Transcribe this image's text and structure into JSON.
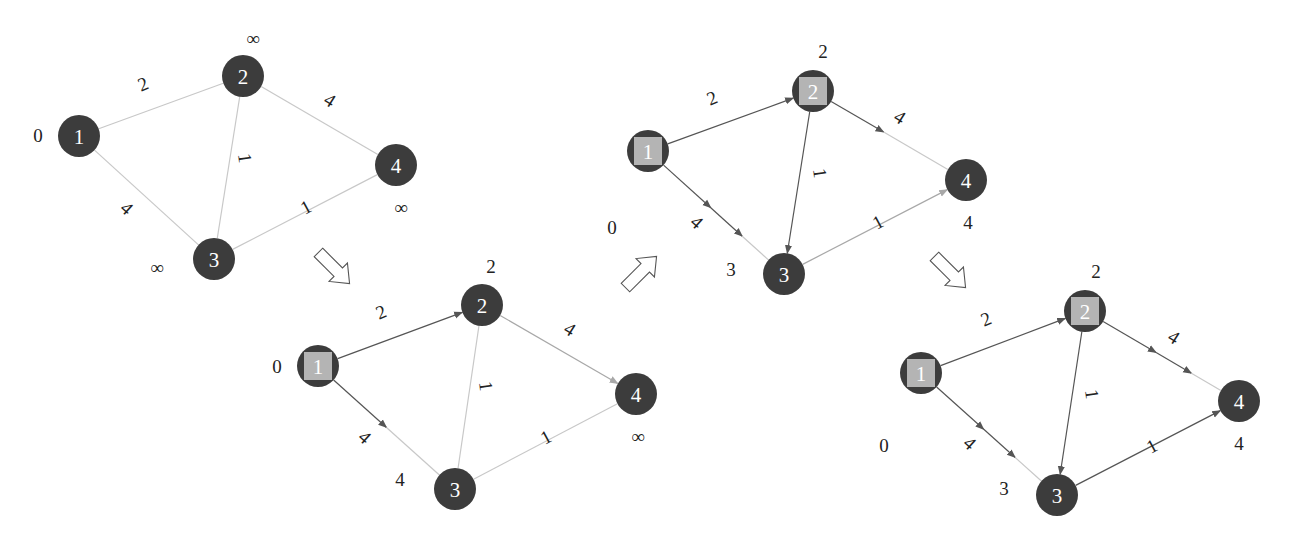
{
  "colors": {
    "node_fill": "#3c3c3c",
    "visited_square": "#b4b4b4",
    "edge_inactive": "#c8c8c8",
    "edge_active": "#555555",
    "edge_candidate": "#a8a8a8",
    "text": "#222222"
  },
  "step_arrows": [
    {
      "name": "step-arrow-1-to-2",
      "x": 334,
      "y": 268,
      "angle": 45
    },
    {
      "name": "step-arrow-2-to-3",
      "x": 641,
      "y": 272,
      "angle": -45
    },
    {
      "name": "step-arrow-3-to-4",
      "x": 950,
      "y": 272,
      "angle": 45
    }
  ],
  "panels": [
    {
      "name": "panel-initial",
      "nodes": [
        {
          "id": "1",
          "x": 79,
          "y": 136,
          "visited": false,
          "dist": "0",
          "dx": -41,
          "dy": -1
        },
        {
          "id": "2",
          "x": 243,
          "y": 76,
          "visited": false,
          "dist": "∞",
          "dx": 10,
          "dy": -38
        },
        {
          "id": "3",
          "x": 214,
          "y": 259,
          "visited": false,
          "dist": "∞",
          "dx": -57,
          "dy": 8
        },
        {
          "id": "4",
          "x": 396,
          "y": 165,
          "visited": false,
          "dist": "∞",
          "dx": 5,
          "dy": 42
        }
      ],
      "edges": [
        {
          "from": "1",
          "to": "2",
          "weight": "2",
          "state": "inactive",
          "lx": 143,
          "ly": 84,
          "rot": -22
        },
        {
          "from": "1",
          "to": "3",
          "weight": "4",
          "state": "inactive",
          "lx": 127,
          "ly": 208,
          "rot": 42
        },
        {
          "from": "2",
          "to": "3",
          "weight": "1",
          "state": "inactive",
          "lx": 245,
          "ly": 158,
          "rot": 82
        },
        {
          "from": "2",
          "to": "4",
          "weight": "4",
          "state": "inactive",
          "lx": 330,
          "ly": 100,
          "rot": 32
        },
        {
          "from": "3",
          "to": "4",
          "weight": "1",
          "state": "inactive",
          "lx": 306,
          "ly": 207,
          "rot": -28
        }
      ]
    },
    {
      "name": "panel-step-1",
      "nodes": [
        {
          "id": "1",
          "x": 318,
          "y": 366,
          "visited": true,
          "dist": "0",
          "dx": -41,
          "dy": 0
        },
        {
          "id": "2",
          "x": 482,
          "y": 305,
          "visited": false,
          "dist": "2",
          "dx": 9,
          "dy": -39
        },
        {
          "id": "3",
          "x": 455,
          "y": 489,
          "visited": false,
          "dist": "4",
          "dx": -55,
          "dy": -10
        },
        {
          "id": "4",
          "x": 636,
          "y": 394,
          "visited": false,
          "dist": "∞",
          "dx": 2,
          "dy": 42
        }
      ],
      "edges": [
        {
          "from": "1",
          "to": "2",
          "weight": "2",
          "state": "active",
          "arrow": true,
          "lx": 381,
          "ly": 312,
          "rot": -22
        },
        {
          "from": "1",
          "to": "3",
          "weight": "4",
          "state": "active",
          "arrow": true,
          "lx": 365,
          "ly": 437,
          "rot": 42
        },
        {
          "from": "2",
          "to": "3",
          "weight": "1",
          "state": "inactive",
          "lx": 486,
          "ly": 386,
          "rot": 82
        },
        {
          "from": "2",
          "to": "4",
          "weight": "4",
          "state": "candidate",
          "arrow": true,
          "lx": 570,
          "ly": 329,
          "rot": 32
        },
        {
          "from": "3",
          "to": "4",
          "weight": "1",
          "state": "inactive",
          "lx": 546,
          "ly": 437,
          "rot": -28
        }
      ]
    },
    {
      "name": "panel-step-2",
      "nodes": [
        {
          "id": "1",
          "x": 648,
          "y": 151,
          "visited": true,
          "dist": "0",
          "dx": -36,
          "dy": 76
        },
        {
          "id": "2",
          "x": 813,
          "y": 91,
          "visited": true,
          "dist": "2",
          "dx": 10,
          "dy": -40
        },
        {
          "id": "3",
          "x": 784,
          "y": 274,
          "visited": false,
          "dist": "3",
          "dx": -53,
          "dy": -5
        },
        {
          "id": "4",
          "x": 966,
          "y": 180,
          "visited": false,
          "dist": "4",
          "dx": 2,
          "dy": 42
        }
      ],
      "edges": [
        {
          "from": "1",
          "to": "2",
          "weight": "2",
          "state": "active",
          "arrow": true,
          "lx": 712,
          "ly": 98,
          "rot": -22
        },
        {
          "from": "1",
          "to": "3",
          "weight": "4",
          "state": "active",
          "arrow": true,
          "double_arrow": true,
          "lx": 697,
          "ly": 222,
          "rot": 42
        },
        {
          "from": "2",
          "to": "3",
          "weight": "1",
          "state": "active",
          "arrow": true,
          "lx": 820,
          "ly": 173,
          "rot": 82
        },
        {
          "from": "2",
          "to": "4",
          "weight": "4",
          "state": "partial",
          "arrow": true,
          "lx": 900,
          "ly": 117,
          "rot": 32
        },
        {
          "from": "3",
          "to": "4",
          "weight": "1",
          "state": "candidate",
          "arrow": true,
          "lx": 878,
          "ly": 222,
          "rot": -28
        }
      ]
    },
    {
      "name": "panel-step-3",
      "nodes": [
        {
          "id": "1",
          "x": 921,
          "y": 373,
          "visited": true,
          "dist": "0",
          "dx": -37,
          "dy": 72
        },
        {
          "id": "2",
          "x": 1085,
          "y": 311,
          "visited": true,
          "dist": "2",
          "dx": 11,
          "dy": -40
        },
        {
          "id": "3",
          "x": 1057,
          "y": 495,
          "visited": false,
          "dist": "3",
          "dx": -53,
          "dy": -7
        },
        {
          "id": "4",
          "x": 1239,
          "y": 401,
          "visited": false,
          "dist": "4",
          "dx": 0,
          "dy": 42
        }
      ],
      "edges": [
        {
          "from": "1",
          "to": "2",
          "weight": "2",
          "state": "active",
          "arrow": true,
          "lx": 986,
          "ly": 319,
          "rot": -22
        },
        {
          "from": "1",
          "to": "3",
          "weight": "4",
          "state": "active",
          "arrow": true,
          "double_arrow": true,
          "lx": 970,
          "ly": 443,
          "rot": 42
        },
        {
          "from": "2",
          "to": "3",
          "weight": "1",
          "state": "active",
          "arrow": true,
          "lx": 1092,
          "ly": 394,
          "rot": 82
        },
        {
          "from": "2",
          "to": "4",
          "weight": "4",
          "state": "partial",
          "arrow": true,
          "double_arrow": true,
          "lx": 1174,
          "ly": 337,
          "rot": 32
        },
        {
          "from": "3",
          "to": "4",
          "weight": "1",
          "state": "active",
          "arrow": true,
          "lx": 1152,
          "ly": 446,
          "rot": -28
        }
      ]
    }
  ]
}
